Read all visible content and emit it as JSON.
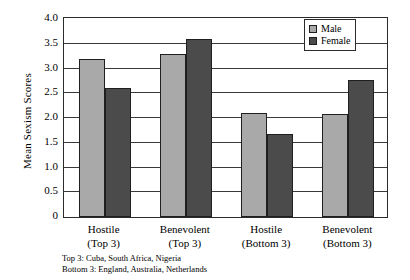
{
  "chart_data": {
    "type": "bar",
    "title": "",
    "xlabel": "",
    "ylabel": "Mean Sexism Scores",
    "ylim": [
      0,
      4.0
    ],
    "grid": true,
    "legend_position": "top-right",
    "categories": [
      "Hostile\n(Top 3)",
      "Benevolent\n(Top 3)",
      "Hostile\n(Bottom 3)",
      "Benevolent\n(Bottom 3)"
    ],
    "category_lines": [
      {
        "line1": "Hostile",
        "line2": "(Top 3)"
      },
      {
        "line1": "Benevolent",
        "line2": "(Top 3)"
      },
      {
        "line1": "Hostile",
        "line2": "(Bottom 3)"
      },
      {
        "line1": "Benevolent",
        "line2": "(Bottom 3)"
      }
    ],
    "series": [
      {
        "name": "Male",
        "color": "#a9a9a9",
        "values": [
          3.2,
          3.3,
          2.1,
          2.08
        ]
      },
      {
        "name": "Female",
        "color": "#4b4b4b",
        "values": [
          2.6,
          3.6,
          1.68,
          2.77
        ]
      }
    ],
    "yticks": [
      "4.0",
      "3.5",
      "3.0",
      "2.5",
      "2.0",
      "1.5",
      "1.0",
      "0.5",
      "0"
    ],
    "ytick_values": [
      4.0,
      3.5,
      3.0,
      2.5,
      2.0,
      1.5,
      1.0,
      0.5,
      0
    ],
    "annotations": [
      "Top 3: Cuba, South Africa, Nigeria",
      "Bottom 3: England, Australia, Netherlands"
    ]
  },
  "legend": {
    "items": [
      {
        "label": "Male"
      },
      {
        "label": "Female"
      }
    ]
  },
  "footnotes": {
    "top": "Top 3: Cuba, South Africa, Nigeria",
    "bottom": "Bottom 3: England, Australia, Netherlands"
  }
}
